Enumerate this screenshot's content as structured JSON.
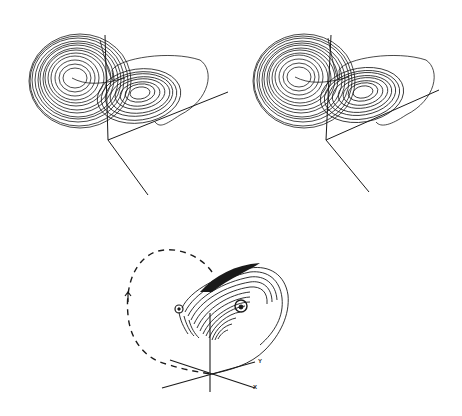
{
  "figure": {
    "ink_color": "#1a1a1a",
    "background": "#ffffff",
    "top_left": {
      "name": "Lorenz attractor left stereo view"
    },
    "top_right": {
      "name": "Lorenz attractor right stereo view"
    },
    "bottom": {
      "name": "Spiral trajectory with dashed return orbit",
      "axes": {
        "x_label": "X",
        "y_label": "Y"
      }
    }
  }
}
